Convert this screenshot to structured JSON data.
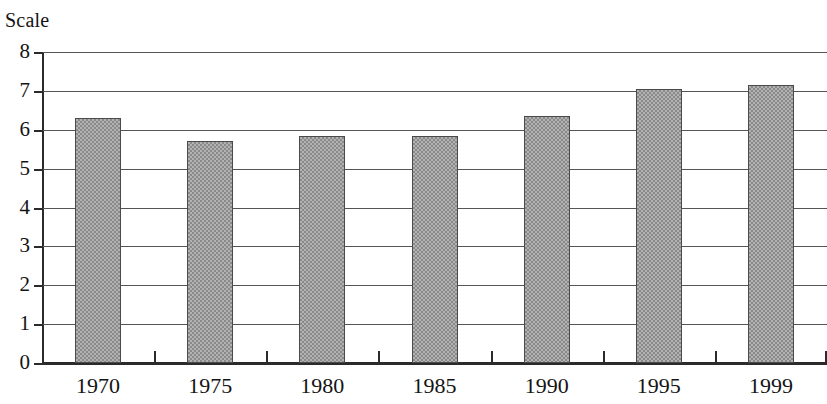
{
  "chart_data": {
    "type": "bar",
    "title": "Scale",
    "xlabel": "",
    "ylabel": "Scale",
    "categories": [
      "1970",
      "1975",
      "1980",
      "1985",
      "1990",
      "1995",
      "1999"
    ],
    "values": [
      6.3,
      5.7,
      5.85,
      5.85,
      6.35,
      7.05,
      7.15
    ],
    "series": [
      {
        "name": "Scale",
        "values": [
          6.3,
          5.7,
          5.85,
          5.85,
          6.35,
          7.05,
          7.15
        ]
      }
    ],
    "ylim": [
      0,
      8
    ],
    "y_ticks": [
      0,
      1,
      2,
      3,
      4,
      5,
      6,
      7,
      8
    ],
    "y_tick_labels": [
      "0",
      "1",
      "2",
      "3",
      "4",
      "5",
      "6",
      "7",
      "8"
    ],
    "grid": true,
    "grid_axis": "y",
    "legend": false,
    "legend_position": "none",
    "bar_fill": "#b2b2b2",
    "bar_pattern": "checkerboard-dither",
    "bar_border_color": "#4a4a4a",
    "axis_color": "#2b2b2b",
    "gridline_color": "#555555",
    "background": "#ffffff",
    "text_color": "#141414"
  }
}
